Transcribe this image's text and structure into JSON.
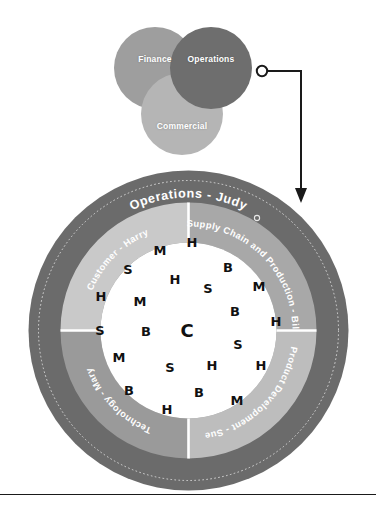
{
  "venn": {
    "circles": [
      {
        "id": "finance",
        "label": "Finance",
        "color": "#9e9e9e"
      },
      {
        "id": "operations",
        "label": "Operations",
        "color": "#6e6e6e"
      },
      {
        "id": "commercial",
        "label": "Commercial",
        "color": "#b5b5b5"
      }
    ]
  },
  "connector": {
    "name": "callout-connector",
    "from": "operations-circle",
    "to": "operations-wheel"
  },
  "wheel": {
    "outer_ring": {
      "title": "Operations - Judy",
      "color": "#6b6b6b"
    },
    "quadrants": [
      {
        "id": "customer",
        "label": "Customer - Harry",
        "color": "#c9c9c9"
      },
      {
        "id": "supply-chain",
        "label": "Supply Chain and Production - Bill",
        "color": "#a8a8a8"
      },
      {
        "id": "product-development",
        "label": "Product Development - Sue",
        "color": "#bdbdbd"
      },
      {
        "id": "technology",
        "label": "Technology - Mary",
        "color": "#9a9a9a"
      }
    ],
    "center": {
      "label": "C",
      "background": "#ffffff"
    },
    "letters": [
      {
        "char": "M",
        "x": 160,
        "y": 250
      },
      {
        "char": "H",
        "x": 192,
        "y": 242
      },
      {
        "char": "S",
        "x": 128,
        "y": 269
      },
      {
        "char": "B",
        "x": 228,
        "y": 267
      },
      {
        "char": "H",
        "x": 175,
        "y": 279
      },
      {
        "char": "S",
        "x": 208,
        "y": 288
      },
      {
        "char": "H",
        "x": 101,
        "y": 296
      },
      {
        "char": "M",
        "x": 140,
        "y": 301
      },
      {
        "char": "M",
        "x": 259,
        "y": 286
      },
      {
        "char": "B",
        "x": 235,
        "y": 311
      },
      {
        "char": "H",
        "x": 276,
        "y": 321
      },
      {
        "char": "S",
        "x": 100,
        "y": 330
      },
      {
        "char": "B",
        "x": 146,
        "y": 331
      },
      {
        "char": "C",
        "x": 187,
        "y": 331
      },
      {
        "char": "S",
        "x": 238,
        "y": 344
      },
      {
        "char": "M",
        "x": 119,
        "y": 357
      },
      {
        "char": "S",
        "x": 170,
        "y": 367
      },
      {
        "char": "H",
        "x": 212,
        "y": 365
      },
      {
        "char": "H",
        "x": 261,
        "y": 365
      },
      {
        "char": "B",
        "x": 129,
        "y": 390
      },
      {
        "char": "B",
        "x": 199,
        "y": 392
      },
      {
        "char": "M",
        "x": 237,
        "y": 400
      },
      {
        "char": "H",
        "x": 167,
        "y": 409
      }
    ]
  },
  "colors": {
    "outer_ring": "#6b6b6b",
    "page_background": "#ffffff",
    "letter": "#111111",
    "rule": "#1a1a1a"
  }
}
